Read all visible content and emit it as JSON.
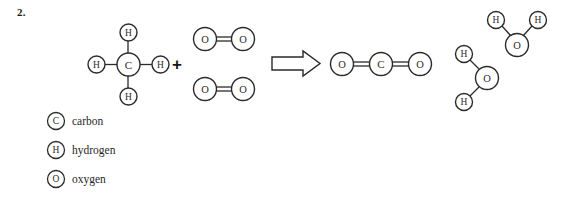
{
  "page": {
    "background": "#ffffff",
    "ink": "#2a2a2a",
    "question_number": "2."
  },
  "equation": {
    "plus_symbol": "+",
    "arrow": "reaction-arrow-right",
    "reactants": [
      {
        "name": "methane",
        "formula": "CH4",
        "atoms": [
          {
            "symbol": "C",
            "kind": "carbon"
          },
          {
            "symbol": "H",
            "kind": "hydrogen"
          },
          {
            "symbol": "H",
            "kind": "hydrogen"
          },
          {
            "symbol": "H",
            "kind": "hydrogen"
          },
          {
            "symbol": "H",
            "kind": "hydrogen"
          }
        ],
        "bonds": "single"
      },
      {
        "name": "oxygen-molecule-1",
        "formula": "O2",
        "atoms": [
          {
            "symbol": "O",
            "kind": "oxygen"
          },
          {
            "symbol": "O",
            "kind": "oxygen"
          }
        ],
        "bonds": "double"
      },
      {
        "name": "oxygen-molecule-2",
        "formula": "O2",
        "atoms": [
          {
            "symbol": "O",
            "kind": "oxygen"
          },
          {
            "symbol": "O",
            "kind": "oxygen"
          }
        ],
        "bonds": "double"
      }
    ],
    "products": [
      {
        "name": "carbon-dioxide",
        "formula": "CO2",
        "atoms": [
          {
            "symbol": "O",
            "kind": "oxygen"
          },
          {
            "symbol": "C",
            "kind": "carbon"
          },
          {
            "symbol": "O",
            "kind": "oxygen"
          }
        ],
        "bonds": "double"
      },
      {
        "name": "water-molecule-1",
        "formula": "H2O",
        "atoms": [
          {
            "symbol": "O",
            "kind": "oxygen"
          },
          {
            "symbol": "H",
            "kind": "hydrogen"
          },
          {
            "symbol": "H",
            "kind": "hydrogen"
          }
        ],
        "bonds": "single"
      },
      {
        "name": "water-molecule-2",
        "formula": "H2O",
        "atoms": [
          {
            "symbol": "O",
            "kind": "oxygen"
          },
          {
            "symbol": "H",
            "kind": "hydrogen"
          },
          {
            "symbol": "H",
            "kind": "hydrogen"
          }
        ],
        "bonds": "single"
      }
    ]
  },
  "atom_symbols": {
    "carbon": "C",
    "hydrogen": "H",
    "oxygen": "O"
  },
  "legend": {
    "items": [
      {
        "symbol": "C",
        "label": "carbon"
      },
      {
        "symbol": "H",
        "label": "hydrogen"
      },
      {
        "symbol": "O",
        "label": "oxygen"
      }
    ]
  }
}
